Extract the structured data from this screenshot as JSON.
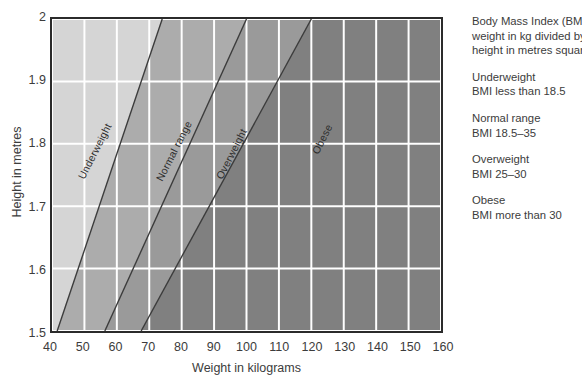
{
  "chart_data": {
    "type": "area",
    "xlabel": "Weight in kilograms",
    "ylabel": "Height in metres",
    "xlim": [
      40,
      160
    ],
    "ylim": [
      1.5,
      2.0
    ],
    "xticks": [
      "40",
      "50",
      "60",
      "70",
      "80",
      "90",
      "100",
      "110",
      "120",
      "130",
      "140",
      "150",
      "160"
    ],
    "xtick_values": [
      40,
      50,
      60,
      70,
      80,
      90,
      100,
      110,
      120,
      130,
      140,
      150,
      160
    ],
    "yticks": [
      "1.5",
      "1.6",
      "1.7",
      "1.8",
      "1.9",
      "2"
    ],
    "ytick_values": [
      1.5,
      1.6,
      1.7,
      1.8,
      1.9,
      2.0
    ],
    "grid": true,
    "grid_color": "#ffffff",
    "legend_position": "right",
    "bands": [
      {
        "name": "Underweight",
        "label": "Underweight",
        "bmi_min": 0,
        "bmi_max": 18.5,
        "color": "#d5d5d5",
        "boundary_at_h1.5_kg": 41.6,
        "boundary_at_h2.0_kg": 74.0
      },
      {
        "name": "Normal range",
        "label": "Normal range",
        "bmi_min": 18.5,
        "bmi_max": 25,
        "color": "#acacac",
        "boundary_at_h1.5_kg": 56.3,
        "boundary_at_h2.0_kg": 100.0
      },
      {
        "name": "Overweight",
        "label": "Overweight",
        "bmi_min": 25,
        "bmi_max": 30,
        "color": "#9a9a9a",
        "boundary_at_h1.5_kg": 67.5,
        "boundary_at_h2.0_kg": 120.0
      },
      {
        "name": "Obese",
        "label": "Obese",
        "bmi_min": 30,
        "bmi_max": null,
        "color": "#808080",
        "boundary_at_h1.5_kg": null,
        "boundary_at_h2.0_kg": null
      }
    ]
  },
  "axes": {
    "y_title": "Height in metres",
    "x_title": "Weight in kilograms"
  },
  "legend": {
    "definition": {
      "line1": "Body Mass Index (BMI)=",
      "line2": "weight in kg divided by",
      "line3": "height in metres squared"
    },
    "entries": [
      {
        "title": "Underweight",
        "detail": "BMI less than 18.5"
      },
      {
        "title": "Normal range",
        "detail": "BMI 18.5–35"
      },
      {
        "title": "Overweight",
        "detail": "BMI 25–30"
      },
      {
        "title": "Obese",
        "detail": "BMI more than 30"
      }
    ]
  },
  "colors": {
    "background": "#ffffff",
    "frame": "#2b2b2b",
    "gridline": "#ffffff",
    "band_boundary": "#3c3c3c",
    "text": "#3c3c3c",
    "underweight": "#d5d5d5",
    "normal": "#acacac",
    "overweight": "#9a9a9a",
    "obese": "#808080"
  }
}
